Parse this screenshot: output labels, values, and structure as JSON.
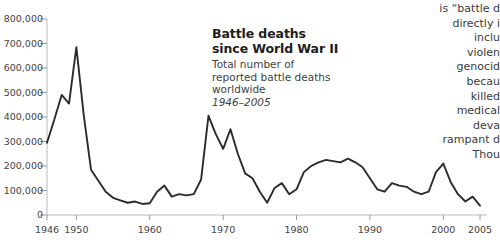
{
  "title": {
    "lines": [
      "Battle deaths",
      "since World War II"
    ]
  },
  "subtitle": {
    "lines": [
      "Total number of",
      "reported battle deaths",
      "worldwide"
    ],
    "daterange": "1946–2005"
  },
  "body_text": {
    "lines": [
      "is “battle d",
      "directly i",
      "inclu",
      "violen",
      "genocid",
      "becau",
      "killed",
      "medical",
      "deva",
      "rampant d",
      "Thou"
    ]
  },
  "colors": {
    "line": "#2b2b2b",
    "axis": "#b9b9b9",
    "tick": "#9a9a9a",
    "text": "#3f3f3f",
    "title": "#1d1d1d",
    "background": "#ffffff"
  },
  "chart_data": {
    "type": "line",
    "subtitle": "Total number of reported battle deaths worldwide",
    "xlabel": "",
    "ylabel": "",
    "xlim": [
      1946,
      2005
    ],
    "ylim": [
      0,
      800000
    ],
    "grid": false,
    "legend": null,
    "y_ticks": [
      0,
      100000,
      200000,
      300000,
      400000,
      500000,
      600000,
      700000,
      800000
    ],
    "y_tick_labels": [
      "0",
      "100,000",
      "200,000",
      "300,000",
      "400,000",
      "500,000",
      "600,000",
      "700,000",
      "800,000"
    ],
    "x_ticks": [
      1946,
      1950,
      1960,
      1970,
      1980,
      1990,
      2000,
      2005
    ],
    "x_tick_labels": [
      "1946",
      "1950",
      "1960",
      "1970",
      "1980",
      "1990",
      "2000",
      "2005"
    ],
    "series": [
      {
        "name": "Reported battle deaths worldwide",
        "x": [
          1946,
          1947,
          1948,
          1949,
          1950,
          1951,
          1952,
          1953,
          1954,
          1955,
          1956,
          1957,
          1958,
          1959,
          1960,
          1961,
          1962,
          1963,
          1964,
          1965,
          1966,
          1967,
          1968,
          1969,
          1970,
          1971,
          1972,
          1973,
          1974,
          1975,
          1976,
          1977,
          1978,
          1979,
          1980,
          1981,
          1982,
          1983,
          1984,
          1985,
          1986,
          1987,
          1988,
          1989,
          1990,
          1991,
          1992,
          1993,
          1994,
          1995,
          1996,
          1997,
          1998,
          1999,
          2000,
          2001,
          2002,
          2003,
          2004,
          2005
        ],
        "values": [
          295000,
          390000,
          490000,
          455000,
          685000,
          410000,
          185000,
          140000,
          95000,
          70000,
          60000,
          50000,
          55000,
          45000,
          48000,
          95000,
          120000,
          75000,
          85000,
          80000,
          85000,
          145000,
          405000,
          330000,
          270000,
          350000,
          250000,
          170000,
          150000,
          95000,
          50000,
          110000,
          130000,
          85000,
          105000,
          175000,
          200000,
          215000,
          225000,
          220000,
          215000,
          230000,
          215000,
          195000,
          150000,
          105000,
          95000,
          130000,
          120000,
          115000,
          95000,
          85000,
          95000,
          175000,
          210000,
          135000,
          85000,
          55000,
          75000,
          38000
        ]
      }
    ]
  }
}
